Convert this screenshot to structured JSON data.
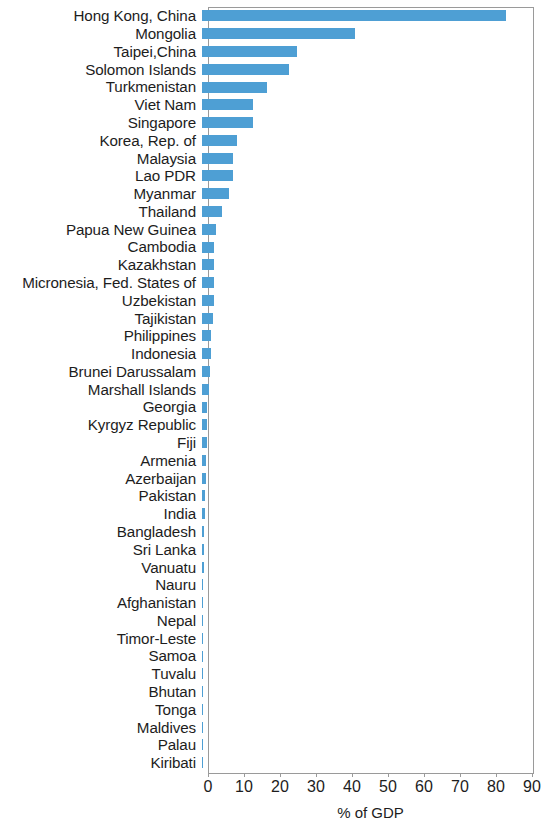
{
  "chart_data": {
    "type": "bar",
    "orientation": "horizontal",
    "title": "",
    "subtitle": "",
    "xlabel": "% of GDP",
    "ylabel": "",
    "xlim": [
      0,
      90
    ],
    "ylim": null,
    "grid": false,
    "legend": null,
    "legend_position": "none",
    "bar_color": "#4e9fd4",
    "axis_color": "#9a9a9a",
    "text_color": "#1d1d1d",
    "xticks": [
      0,
      10,
      20,
      30,
      40,
      50,
      60,
      70,
      80,
      90
    ],
    "xtick_labels": [
      "0",
      "10",
      "20",
      "30",
      "40",
      "50",
      "60",
      "70",
      "80",
      "90"
    ],
    "categories": [
      "Hong Kong, China",
      "Mongolia",
      "Taipei,China",
      "Solomon Islands",
      "Turkmenistan",
      "Viet Nam",
      "Singapore",
      "Korea, Rep. of",
      "Malaysia",
      "Lao PDR",
      "Myanmar",
      "Thailand",
      "Papua New Guinea",
      "Cambodia",
      "Kazakhstan",
      "Micronesia, Fed. States of",
      "Uzbekistan",
      "Tajikistan",
      "Philippines",
      "Indonesia",
      "Brunei Darussalam",
      "Marshall Islands",
      "Georgia",
      "Kyrgyz Republic",
      "Fiji",
      "Armenia",
      "Azerbaijan",
      "Pakistan",
      "India",
      "Bangladesh",
      "Sri Lanka",
      "Vanuatu",
      "Nauru",
      "Afghanistan",
      "Nepal",
      "Timor-Leste",
      "Samoa",
      "Tuvalu",
      "Bhutan",
      "Tonga",
      "Maldives",
      "Palau",
      "Kiribati"
    ],
    "values": [
      84.4,
      42.5,
      26.4,
      24.2,
      18.0,
      14.2,
      14.2,
      9.7,
      8.7,
      8.7,
      7.5,
      5.5,
      4.0,
      3.4,
      3.4,
      3.3,
      3.2,
      3.0,
      2.6,
      2.4,
      2.2,
      1.9,
      1.5,
      1.4,
      1.3,
      1.1,
      1.0,
      0.9,
      0.8,
      0.6,
      0.5,
      0.45,
      0.4,
      0.35,
      0.3,
      0.3,
      0.25,
      0.2,
      0.2,
      0.15,
      0.1,
      0.1,
      0.05
    ],
    "value_unit": "% of GDP"
  }
}
